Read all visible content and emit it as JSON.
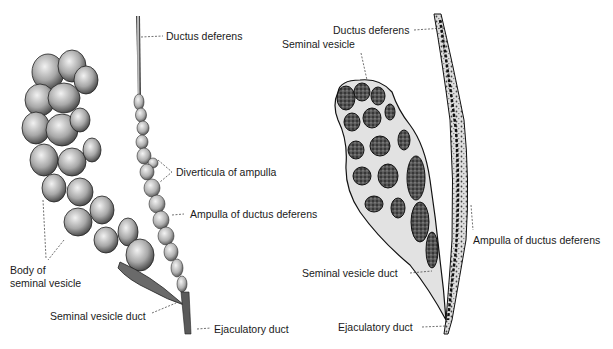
{
  "left_figure": {
    "title": "External view",
    "labels": {
      "ductus_deferens": "Ductus deferens",
      "diverticula": "Diverticula of ampulla",
      "ampulla": "Ampulla of ductus deferens",
      "body_line1": "Body of",
      "body_line2": "seminal vesicle",
      "sv_duct": "Seminal vesicle duct",
      "ejaculatory": "Ejaculatory duct"
    }
  },
  "right_figure": {
    "title": "Sectioned view",
    "labels": {
      "ductus_deferens": "Ductus deferens",
      "seminal_vesicle": "Seminal vesicle",
      "ampulla": "Ampulla of ductus deferens",
      "sv_duct": "Seminal vesicle duct",
      "ejaculatory": "Ejaculatory duct"
    }
  },
  "colors": {
    "ink": "#1a1a1a",
    "tissue_light": "#d9d9d9",
    "tissue_mid": "#9a9a9a",
    "tissue_dark": "#3a3a3a",
    "background": "#ffffff"
  }
}
